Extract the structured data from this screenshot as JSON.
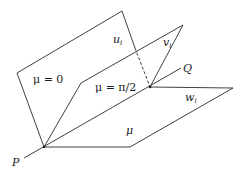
{
  "diagram": {
    "type": "three half-planes sharing a common edge line PQ",
    "points": {
      "P": {
        "label": "P"
      },
      "Q": {
        "label": "Q"
      }
    },
    "planes": [
      {
        "id": "mu-zero",
        "label": "μ = 0"
      },
      {
        "id": "mu-half-pi",
        "label": "μ = π/2"
      },
      {
        "id": "mu-general",
        "label": "μ"
      }
    ],
    "vectors": [
      {
        "id": "u",
        "base": "u",
        "sub": "i"
      },
      {
        "id": "v",
        "base": "v",
        "sub": "i"
      },
      {
        "id": "w",
        "base": "w",
        "sub": "i"
      }
    ],
    "line_color": "#2a2a2a"
  }
}
